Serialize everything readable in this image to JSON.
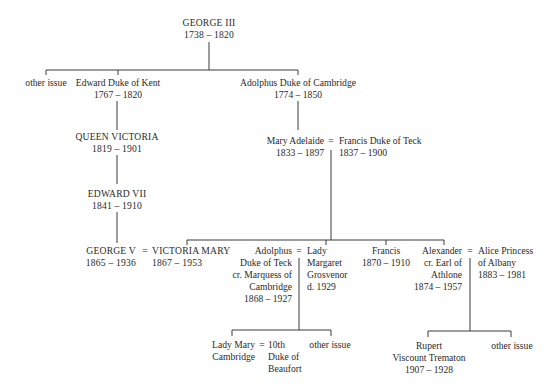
{
  "diagram": {
    "type": "family-tree",
    "nodes": {
      "george3": {
        "name": "GEORGE III",
        "dates": "1738 – 1820"
      },
      "other_issue_1": {
        "name": "other issue"
      },
      "edward_kent": {
        "name": "Edward Duke of Kent",
        "dates": "1767 – 1820"
      },
      "adolphus_cambridge": {
        "name": "Adolphus Duke of Cambridge",
        "dates": "1774 – 1850"
      },
      "queen_victoria": {
        "name": "QUEEN VICTORIA",
        "dates": "1819 – 1901"
      },
      "edward7": {
        "name": "EDWARD VII",
        "dates": "1841 – 1910"
      },
      "george5": {
        "name": "GEORGE V",
        "dates": "1865 – 1936"
      },
      "victoria_mary": {
        "name": "VICTORIA MARY",
        "dates": "1867 – 1953"
      },
      "mary_adelaide": {
        "name": "Mary Adelaide",
        "dates": "1833 – 1897"
      },
      "francis_teck": {
        "name": "Francis Duke of Teck",
        "dates": "1837 – 1900"
      },
      "adolphus_teck": {
        "line1": "Adolphus",
        "line2": "Duke of Teck",
        "line3": "cr. Marquess of",
        "line4": "Cambridge",
        "dates": "1868 – 1927"
      },
      "lady_margaret": {
        "line1": "Lady",
        "line2": "Margaret",
        "line3": "Grosvenor",
        "dates": "d. 1929"
      },
      "francis": {
        "name": "Francis",
        "dates": "1870 – 1910"
      },
      "alexander": {
        "line1": "Alexander",
        "line2": "cr. Earl of",
        "line3": "Athlone",
        "dates": "1874 – 1957"
      },
      "alice": {
        "line1": "Alice Princess",
        "line2": "of Albany",
        "dates": "1883 – 1981"
      },
      "lady_mary": {
        "line1": "Lady Mary",
        "line2": "Cambridge"
      },
      "beaufort": {
        "line1": "10th",
        "line2": "Duke of",
        "line3": "Beaufort"
      },
      "other_issue_2": {
        "name": "other issue"
      },
      "rupert": {
        "line1": "Rupert",
        "line2": "Viscount Trematon",
        "dates": "1907 – 1928"
      },
      "other_issue_3": {
        "name": "other issue"
      }
    },
    "marriage_symbol": "="
  }
}
